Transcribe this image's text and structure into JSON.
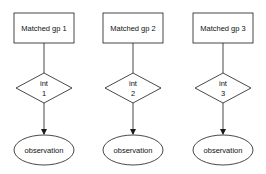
{
  "diagram": {
    "type": "flowchart",
    "colors": {
      "stroke": "#1a1a1a",
      "fill": "#ffffff",
      "text": "#111111"
    },
    "columns": [
      {
        "group": {
          "label": "Matched gp 1"
        },
        "decision": {
          "line1": "int",
          "line2": "1"
        },
        "outcome": {
          "label": "observation"
        }
      },
      {
        "group": {
          "label": "Matched gp 2"
        },
        "decision": {
          "line1": "int",
          "line2": "2"
        },
        "outcome": {
          "label": "observation"
        }
      },
      {
        "group": {
          "label": "Matched gp 3"
        },
        "decision": {
          "line1": "int",
          "line2": "3"
        },
        "outcome": {
          "label": "observation"
        }
      }
    ],
    "edges": [
      {
        "from": "Matched gp 1",
        "to": "int 1",
        "arrow": false
      },
      {
        "from": "int 1",
        "to": "observation",
        "arrow": true
      },
      {
        "from": "Matched gp 2",
        "to": "int 2",
        "arrow": false
      },
      {
        "from": "int 2",
        "to": "observation",
        "arrow": true
      },
      {
        "from": "Matched gp 3",
        "to": "int 3",
        "arrow": false
      },
      {
        "from": "int 3",
        "to": "observation",
        "arrow": true
      }
    ]
  }
}
